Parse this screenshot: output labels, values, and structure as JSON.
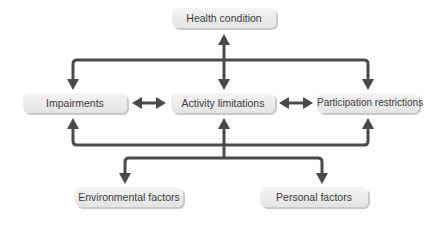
{
  "diagram": {
    "type": "flow-diagram",
    "colors": {
      "arrow": "#4a4a4a",
      "box_fill": "#ececec",
      "box_shadow": "#c9c9c9",
      "text": "#3a3a3a",
      "background": "#ffffff"
    },
    "nodes": {
      "health_condition": "Health condition",
      "impairments": "Impairments",
      "activity_limitations": "Activity limitations",
      "participation_restrictions": "Participation restrictions",
      "environmental_factors": "Environmental factors",
      "personal_factors": "Personal factors"
    },
    "edges": [
      {
        "from": "Health condition",
        "to": "Activity limitations",
        "direction": "bidirectional"
      },
      {
        "from": "Health condition",
        "to": "Impairments",
        "direction": "one-way"
      },
      {
        "from": "Health condition",
        "to": "Participation restrictions",
        "direction": "one-way"
      },
      {
        "from": "Impairments",
        "to": "Activity limitations",
        "direction": "bidirectional"
      },
      {
        "from": "Activity limitations",
        "to": "Participation restrictions",
        "direction": "bidirectional"
      },
      {
        "from": "Contextual factors",
        "to": "Impairments",
        "direction": "one-way"
      },
      {
        "from": "Contextual factors",
        "to": "Activity limitations",
        "direction": "one-way"
      },
      {
        "from": "Contextual factors",
        "to": "Participation restrictions",
        "direction": "one-way"
      },
      {
        "from": "Activity limitations",
        "to": "Environmental factors",
        "direction": "one-way"
      },
      {
        "from": "Activity limitations",
        "to": "Personal factors",
        "direction": "one-way"
      }
    ]
  }
}
